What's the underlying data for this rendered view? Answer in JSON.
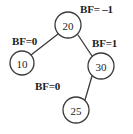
{
  "figure": {
    "type": "binary-tree-diagram",
    "width": 133,
    "height": 134,
    "background_color": "#ffffff",
    "stroke_color": "#3a3a3a",
    "text_color": "#1c1c1c"
  },
  "nodes": {
    "root": {
      "value": "20",
      "cx": 68,
      "cy": 25,
      "r": 13
    },
    "left": {
      "value": "10",
      "cx": 22,
      "cy": 63,
      "r": 12
    },
    "right": {
      "value": "30",
      "cx": 101,
      "cy": 66,
      "r": 13
    },
    "grandchild": {
      "value": "25",
      "cx": 76,
      "cy": 110,
      "r": 13
    }
  },
  "balance_factors": {
    "root": "BF= –1",
    "left": "BF=0",
    "right": "BF=1",
    "grandchild": "BF=0"
  },
  "edges": [
    {
      "from": "20",
      "to": "10"
    },
    {
      "from": "20",
      "to": "30"
    },
    {
      "from": "30",
      "to": "25"
    }
  ]
}
